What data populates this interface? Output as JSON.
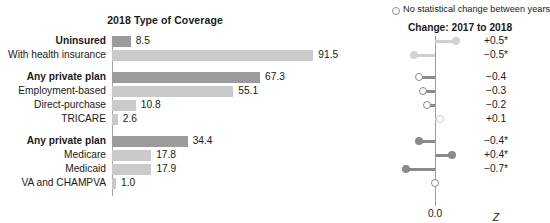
{
  "left": {
    "title": "2018 Type of Coverage",
    "axis_name": "bar-baseline"
  },
  "right": {
    "legend": {
      "marker": "open-circle-icon",
      "text": "No statistical change between years"
    },
    "title": "Change: 2017 to 2018",
    "axis_label": "0.0",
    "axis_stat": "Z"
  },
  "chart_data": [
    {
      "type": "bar",
      "title": "2018 Type of Coverage",
      "xlabel": "",
      "ylabel": "",
      "orientation": "horizontal",
      "xlim": [
        0,
        100
      ],
      "grid": false,
      "colors": {
        "emphasis": "#9b9b9b",
        "normal": "#cacaca"
      },
      "categories": [
        "Uninsured",
        "With health insurance",
        "Any private plan",
        "Employment-based",
        "Direct-purchase",
        "TRICARE",
        "Any private plan",
        "Medicare",
        "Medicaid",
        "VA and CHAMPVA"
      ],
      "values": [
        8.5,
        91.5,
        67.3,
        55.1,
        10.8,
        2.6,
        34.4,
        17.8,
        17.9,
        1.0
      ],
      "value_labels": [
        "8.5",
        "91.5",
        "67.3",
        "55.1",
        "10.8",
        "2.6",
        "34.4",
        "17.8",
        "17.9",
        "1.0"
      ],
      "bold_categories": [
        "Uninsured",
        "Any private plan"
      ],
      "shades": [
        "dark",
        "light",
        "dark",
        "light",
        "light",
        "light",
        "dark",
        "light",
        "light",
        "light"
      ],
      "groups": [
        [
          0,
          1
        ],
        [
          2,
          3,
          4,
          5
        ],
        [
          6,
          7,
          8,
          9
        ]
      ]
    },
    {
      "type": "scatter",
      "title": "Change: 2017 to 2018",
      "xlabel": "0.0",
      "ylabel": "",
      "legend": "No statistical change between years",
      "axis_zero": 0.0,
      "stat_symbol": "Z",
      "categories": [
        "Uninsured",
        "With health insurance",
        "Any private plan",
        "Employment-based",
        "Direct-purchase",
        "TRICARE",
        "Any private plan",
        "Medicare",
        "Medicaid",
        "VA and CHAMPVA"
      ],
      "values": [
        0.5,
        -0.5,
        -0.4,
        -0.3,
        -0.2,
        0.1,
        -0.4,
        0.4,
        -0.7,
        0.0
      ],
      "value_labels": [
        "+0.5*",
        "−0.5*",
        "−0.4",
        "−0.3",
        "−0.2",
        "+0.1",
        "−0.4*",
        "+0.4*",
        "−0.7*",
        ""
      ],
      "significant": [
        true,
        true,
        false,
        false,
        false,
        false,
        true,
        true,
        true,
        false
      ],
      "marker_styles": [
        "filled-light",
        "filled-light",
        "open",
        "open",
        "open",
        "open-light",
        "filled-dark",
        "filled-dark",
        "filled-dark",
        "open"
      ]
    }
  ],
  "rows": [
    {
      "label": "Uninsured",
      "bold": true,
      "value": "8.5",
      "num": 8.5,
      "shade": "dark",
      "top": 0,
      "change": "+0.5*",
      "cnum": 0.5,
      "marker": "filled-light",
      "line": "light"
    },
    {
      "label": "With health insurance",
      "bold": false,
      "value": "91.5",
      "num": 91.5,
      "shade": "light",
      "top": 14,
      "change": "−0.5*",
      "cnum": -0.5,
      "marker": "filled-light",
      "line": "light"
    },
    {
      "label": "Any private plan",
      "bold": true,
      "value": "67.3",
      "num": 67.3,
      "shade": "dark",
      "top": 36,
      "change": "−0.4",
      "cnum": -0.4,
      "marker": "open",
      "line": "dark"
    },
    {
      "label": "Employment-based",
      "bold": false,
      "value": "55.1",
      "num": 55.1,
      "shade": "light",
      "top": 50,
      "change": "−0.3",
      "cnum": -0.3,
      "marker": "open",
      "line": "dark"
    },
    {
      "label": "Direct-purchase",
      "bold": false,
      "value": "10.8",
      "num": 10.8,
      "shade": "light",
      "top": 64,
      "change": "−0.2",
      "cnum": -0.2,
      "marker": "open",
      "line": "dark"
    },
    {
      "label": "TRICARE",
      "bold": false,
      "value": "2.6",
      "num": 2.6,
      "shade": "light",
      "top": 78,
      "change": "+0.1",
      "cnum": 0.1,
      "marker": "open-light",
      "line": "light"
    },
    {
      "label": "Any private plan",
      "bold": true,
      "value": "34.4",
      "num": 34.4,
      "shade": "dark",
      "top": 100,
      "change": "−0.4*",
      "cnum": -0.4,
      "marker": "filled-dark",
      "line": "dark"
    },
    {
      "label": "Medicare",
      "bold": false,
      "value": "17.8",
      "num": 17.8,
      "shade": "light",
      "top": 114,
      "change": "+0.4*",
      "cnum": 0.4,
      "marker": "filled-dark",
      "line": "dark"
    },
    {
      "label": "Medicaid",
      "bold": false,
      "value": "17.9",
      "num": 17.9,
      "shade": "light",
      "top": 128,
      "change": "−0.7*",
      "cnum": -0.7,
      "marker": "filled-dark",
      "line": "dark"
    },
    {
      "label": "VA and CHAMPVA",
      "bold": false,
      "value": "1.0",
      "num": 1.0,
      "shade": "light",
      "top": 142,
      "change": "",
      "cnum": 0.0,
      "marker": "open",
      "line": "dark"
    }
  ]
}
